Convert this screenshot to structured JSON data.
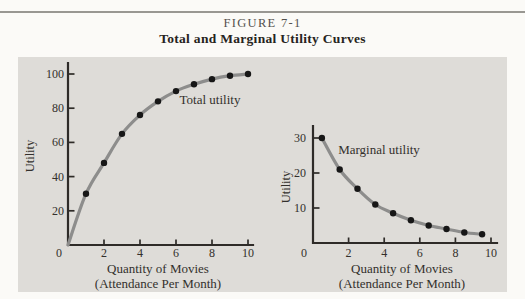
{
  "figure": {
    "label": "FIGURE 7-1",
    "title": "Total and Marginal Utility Curves"
  },
  "colors": {
    "page_bg": "#fbfaf7",
    "panel_bg": "#dedcd8",
    "rule": "#999792",
    "header_label": "#54514d",
    "header_title": "#262320",
    "axis": "#2e2b28",
    "tick_text": "#33302c",
    "curve": "#8d8d8c",
    "dot": "#171717",
    "annotation_text": "#33302c"
  },
  "chart_data": [
    {
      "type": "line",
      "name": "total-utility",
      "annotation": "Total utility",
      "x": [
        1,
        2,
        3,
        4,
        5,
        6,
        7,
        8,
        9,
        10
      ],
      "y": [
        30,
        48,
        65,
        76,
        84,
        90,
        94,
        97,
        99,
        100
      ],
      "curve_from_origin": true,
      "xlabel": "Quantity of Movies",
      "xlabel_sub": "(Attendance Per Month)",
      "ylabel": "Utility",
      "origin_label": "0",
      "xticks": [
        2,
        4,
        6,
        8,
        10
      ],
      "yticks": [
        20,
        40,
        60,
        80,
        100
      ],
      "xlim": [
        0,
        10.3
      ],
      "ylim": [
        0,
        106
      ],
      "grid": false,
      "legend": "none"
    },
    {
      "type": "line",
      "name": "marginal-utility",
      "annotation": "Marginal utility",
      "x": [
        0.5,
        1.5,
        2.5,
        3.5,
        4.5,
        5.5,
        6.5,
        7.5,
        8.5,
        9.5
      ],
      "y": [
        30,
        21,
        15.5,
        11,
        8.5,
        6.5,
        5,
        4,
        3,
        2.5
      ],
      "curve_from_origin": false,
      "xlabel": "Quantity of Movies",
      "xlabel_sub": "(Attendance Per Month)",
      "ylabel": "Utility",
      "origin_label": "0",
      "xticks": [
        2,
        4,
        6,
        8,
        10
      ],
      "yticks": [
        10,
        20,
        30
      ],
      "xlim": [
        0,
        10.3
      ],
      "ylim": [
        0,
        33.5
      ],
      "grid": false,
      "legend": "none"
    }
  ]
}
